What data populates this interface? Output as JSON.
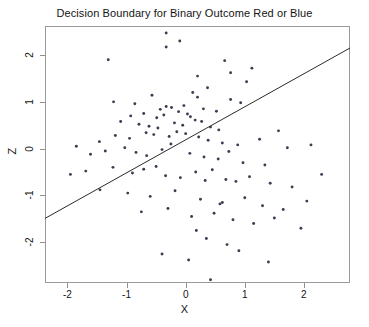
{
  "chart_data": {
    "type": "scatter",
    "title": "Decision Boundary for Binary Outcome Red or Blue",
    "xlabel": "X",
    "ylabel": "Z",
    "xlim": [
      -2.38,
      2.78
    ],
    "ylim": [
      -2.87,
      2.62
    ],
    "xticks": [
      -2,
      -1,
      0,
      1,
      2
    ],
    "xtick_labels": [
      "-2",
      "-1",
      "0",
      "1",
      "2"
    ],
    "yticks": [
      2,
      1,
      0,
      -1,
      -2
    ],
    "ytick_labels": [
      "2",
      "1",
      "0",
      "-1",
      "-2"
    ],
    "grid": false,
    "legend": "none",
    "point_color": "#3d3d52",
    "line_color": "#2b2b2b",
    "frame_color": "#9a9a9a",
    "annotations": [
      {
        "name": "decision-boundary",
        "type": "line",
        "x": [
          -2.38,
          2.78
        ],
        "y": [
          -1.49,
          2.15
        ]
      }
    ],
    "series": [
      {
        "name": "observations",
        "marker": "point",
        "x": [
          -0.33,
          -0.33,
          -0.1,
          -1.31,
          0.66,
          1.12,
          0.2,
          0.76,
          0.2,
          -0.57,
          -1.22,
          -0.86,
          -0.33,
          -0.43,
          0.37,
          0.12,
          -0.03,
          0.3,
          0.52,
          0.76,
          0.93,
          1.03,
          -0.93,
          -0.71,
          -0.49,
          -0.37,
          -0.24,
          -0.12,
          0.03,
          0.08,
          0.16,
          -0.19,
          -0.05,
          0.27,
          0.42,
          0.56,
          -1.1,
          -0.79,
          -0.62,
          -0.47,
          -1.46,
          -1.19,
          -0.95,
          -0.67,
          -0.54,
          -0.28,
          -0.15,
          0.0,
          0.22,
          0.38,
          0.62,
          0.88,
          1.25,
          1.57,
          -1.85,
          -1.61,
          -1.36,
          -1.03,
          -0.84,
          -0.66,
          -0.4,
          -0.25,
          0.07,
          0.31,
          0.55,
          0.73,
          0.97,
          1.34,
          1.72,
          2.12,
          -1.95,
          -1.69,
          -1.23,
          -0.9,
          -0.71,
          -0.5,
          -0.34,
          -0.09,
          0.17,
          0.45,
          0.68,
          0.85,
          1.08,
          1.43,
          1.8,
          2.3,
          -1.45,
          -0.98,
          -0.6,
          -0.18,
          0.25,
          0.62,
          1.0,
          1.3,
          1.65,
          2.05,
          -0.75,
          -0.3,
          0.1,
          0.48,
          0.8,
          1.15,
          1.5,
          1.95,
          0.35,
          0.7,
          -0.4,
          0.05,
          0.9,
          1.4,
          0.42,
          0.33,
          0.58,
          0.18
        ],
        "y": [
          2.47,
          2.17,
          2.3,
          1.9,
          1.88,
          1.72,
          1.55,
          1.62,
          1.1,
          1.14,
          1.0,
          0.96,
          0.9,
          0.84,
          1.3,
          1.2,
          0.92,
          0.85,
          0.8,
          1.05,
          0.98,
          1.43,
          0.7,
          0.75,
          0.66,
          0.72,
          0.88,
          0.79,
          0.74,
          0.68,
          0.61,
          0.55,
          0.5,
          0.58,
          0.46,
          0.4,
          0.58,
          0.52,
          0.48,
          0.44,
          0.15,
          0.28,
          0.22,
          0.34,
          0.3,
          0.26,
          0.36,
          0.32,
          0.25,
          0.18,
          0.12,
          0.08,
          0.2,
          0.38,
          0.05,
          -0.12,
          -0.05,
          0.02,
          -0.08,
          -0.15,
          -0.02,
          0.1,
          -0.1,
          -0.18,
          -0.22,
          -0.06,
          -0.3,
          -0.35,
          0.02,
          0.08,
          -0.55,
          -0.48,
          -0.4,
          -0.52,
          -0.44,
          -0.38,
          -0.58,
          -0.62,
          -0.5,
          -0.45,
          -0.66,
          -0.7,
          -0.6,
          -0.74,
          -0.82,
          -0.55,
          -0.88,
          -0.95,
          -1.02,
          -0.9,
          -1.08,
          -1.15,
          -1.05,
          -1.22,
          -1.3,
          -1.12,
          -1.35,
          -1.28,
          -1.45,
          -1.38,
          -1.52,
          -1.6,
          -1.48,
          -1.7,
          -1.92,
          -2.05,
          -2.25,
          -2.38,
          -2.18,
          -2.42,
          -2.8,
          -0.68,
          -1.18,
          -1.75
        ]
      }
    ]
  }
}
